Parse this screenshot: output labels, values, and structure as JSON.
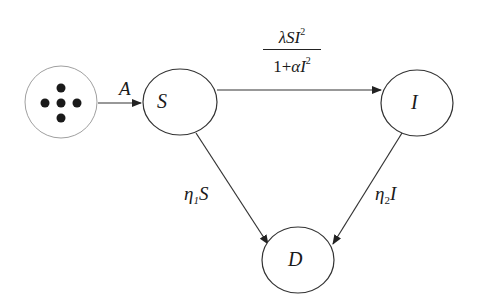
{
  "diagram": {
    "type": "compartment-flow",
    "nodes": [
      {
        "id": "source",
        "label": "",
        "icon": "dots-cross-icon"
      },
      {
        "id": "S",
        "label": "S"
      },
      {
        "id": "I",
        "label": "I"
      },
      {
        "id": "D",
        "label": "D"
      }
    ],
    "edges": [
      {
        "from": "source",
        "to": "S",
        "label": "A"
      },
      {
        "from": "S",
        "to": "I",
        "label_num_lambda": "λ",
        "label_num_rest": "SI",
        "label_num_sup": "2",
        "label_den_one": "1+",
        "label_den_alpha": "α",
        "label_den_I": "I",
        "label_den_sup": "2"
      },
      {
        "from": "S",
        "to": "D",
        "label_eta": "η",
        "label_sub": "1",
        "label_var": "S"
      },
      {
        "from": "I",
        "to": "D",
        "label_eta": "η",
        "label_sub": "2",
        "label_var": "I"
      }
    ]
  },
  "colors": {
    "stroke": "#333333",
    "source_stroke": "#9a9a9a",
    "dots": "#1a1a1a"
  }
}
